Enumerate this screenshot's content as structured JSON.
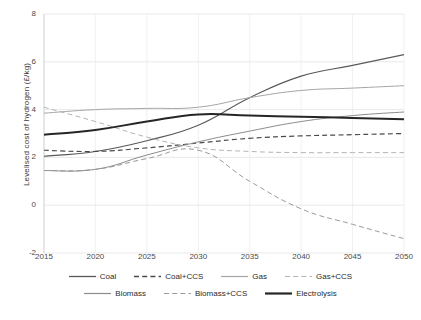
{
  "chart_data": {
    "type": "line",
    "title": "",
    "subtitle": "",
    "xlabel": "",
    "ylabel": "Levelised cost of hydrogen (£/kg)",
    "x": [
      2015,
      2020,
      2025,
      2030,
      2035,
      2040,
      2045,
      2050
    ],
    "xtick_labels": [
      "2015",
      "2020",
      "2025",
      "2030",
      "2035",
      "2040",
      "2045",
      "2050"
    ],
    "ytick_labels": [
      "-2",
      "0",
      "2",
      "4",
      "6",
      "8"
    ],
    "ytick_values": [
      -2,
      0,
      2,
      4,
      6,
      8
    ],
    "xlim": [
      2015,
      2050
    ],
    "ylim": [
      -2,
      8
    ],
    "grid": true,
    "grid_axis": "both",
    "legend_position": "bottom",
    "series": [
      {
        "name": "Coal",
        "color": "#595959",
        "style": "solid",
        "width": 1.1,
        "values": [
          2.05,
          2.25,
          2.7,
          3.35,
          4.5,
          5.4,
          5.85,
          6.3
        ]
      },
      {
        "name": "Coal+CCS",
        "color": "#4a4a4a",
        "style": "dashed",
        "width": 1.2,
        "values": [
          2.3,
          2.25,
          2.4,
          2.6,
          2.8,
          2.9,
          2.95,
          3.0
        ]
      },
      {
        "name": "Gas",
        "color": "#a6a6a6",
        "style": "solid",
        "width": 1.0,
        "values": [
          3.85,
          4.0,
          4.05,
          4.1,
          4.5,
          4.8,
          4.9,
          5.0
        ]
      },
      {
        "name": "Gas+CCS",
        "color": "#b4b4b4",
        "style": "dashed",
        "width": 1.0,
        "values": [
          4.1,
          3.5,
          2.85,
          2.4,
          2.25,
          2.2,
          2.2,
          2.2
        ]
      },
      {
        "name": "Biomass",
        "color": "#8c8c8c",
        "style": "solid",
        "width": 1.0,
        "values": [
          1.45,
          1.5,
          2.1,
          2.65,
          3.1,
          3.5,
          3.75,
          3.9
        ]
      },
      {
        "name": "Biomass+CCS",
        "color": "#9a9a9a",
        "style": "dashed",
        "width": 1.0,
        "values": [
          1.45,
          1.5,
          1.95,
          2.3,
          1.0,
          -0.15,
          -0.8,
          -1.4
        ]
      },
      {
        "name": "Electrolysis",
        "color": "#262626",
        "style": "solid",
        "width": 2.0,
        "values": [
          2.95,
          3.15,
          3.5,
          3.8,
          3.75,
          3.7,
          3.65,
          3.6
        ]
      }
    ]
  },
  "axis": {
    "ylabel": "Levelised cost of hydrogen (£/kg)",
    "yticks": [
      "8",
      "6",
      "4",
      "2",
      "0",
      "-2"
    ],
    "xticks": [
      "2015",
      "2020",
      "2025",
      "2030",
      "2035",
      "2040",
      "2045",
      "2050"
    ]
  },
  "legend": {
    "row1": [
      {
        "label": "Coal",
        "style": "solid",
        "color": "#595959",
        "width": 1.3
      },
      {
        "label": "Coal+CCS",
        "style": "dashed",
        "color": "#4a4a4a",
        "width": 1.3
      },
      {
        "label": "Gas",
        "style": "solid",
        "color": "#a6a6a6",
        "width": 1.2
      },
      {
        "label": "Gas+CCS",
        "style": "dashed",
        "color": "#b4b4b4",
        "width": 1.2
      }
    ],
    "row2": [
      {
        "label": "Biomass",
        "style": "solid",
        "color": "#8c8c8c",
        "width": 1.2
      },
      {
        "label": "Biomass+CCS",
        "style": "dashed",
        "color": "#9a9a9a",
        "width": 1.2
      },
      {
        "label": "Electrolysis",
        "style": "solid",
        "color": "#262626",
        "width": 2.2
      }
    ]
  },
  "caption": {
    "text": ""
  }
}
